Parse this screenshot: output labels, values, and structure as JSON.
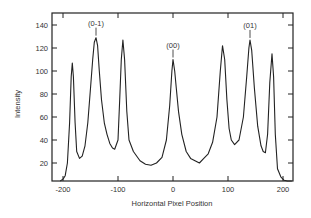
{
  "chart_data": {
    "type": "line",
    "title": "",
    "xlabel": "Horizontal Pixel Position",
    "ylabel": "Intensity",
    "xlim": [
      -220,
      220
    ],
    "ylim": [
      4,
      150
    ],
    "xticks": [
      -200,
      -100,
      0,
      100,
      200
    ],
    "yticks": [
      20,
      40,
      60,
      80,
      100,
      120,
      140
    ],
    "grid": false,
    "legend": null,
    "annotations": [
      {
        "text": "(0-1)",
        "x": -140,
        "y": 129
      },
      {
        "text": "(00)",
        "x": 0,
        "y": 110
      },
      {
        "text": "(01)",
        "x": 140,
        "y": 127
      }
    ],
    "series": [
      {
        "name": "Intensity profile",
        "x": [
          -205,
          -200,
          -196,
          -192,
          -188,
          -185,
          -183,
          -181,
          -178,
          -175,
          -170,
          -165,
          -160,
          -155,
          -150,
          -146,
          -143,
          -140,
          -137,
          -134,
          -130,
          -125,
          -120,
          -115,
          -110,
          -106,
          -100,
          -97,
          -94,
          -91,
          -88,
          -84,
          -80,
          -72,
          -60,
          -50,
          -40,
          -30,
          -20,
          -12,
          -6,
          -2,
          0,
          3,
          6,
          10,
          16,
          24,
          32,
          40,
          48,
          56,
          64,
          72,
          80,
          86,
          90,
          94,
          98,
          102,
          106,
          112,
          120,
          128,
          134,
          138,
          140,
          143,
          148,
          154,
          160,
          164,
          168,
          172,
          176,
          180,
          183,
          186,
          190,
          196,
          202,
          208,
          216
        ],
        "y": [
          4,
          6,
          9,
          20,
          55,
          95,
          107,
          95,
          55,
          30,
          24,
          26,
          35,
          55,
          85,
          110,
          125,
          129,
          122,
          100,
          75,
          55,
          45,
          37,
          33,
          32,
          40,
          75,
          110,
          127,
          110,
          65,
          40,
          30,
          22,
          19,
          18,
          20,
          25,
          40,
          70,
          100,
          110,
          100,
          85,
          65,
          45,
          30,
          24,
          22,
          20,
          24,
          28,
          38,
          60,
          100,
          122,
          110,
          75,
          50,
          40,
          36,
          40,
          60,
          95,
          120,
          127,
          118,
          85,
          52,
          35,
          30,
          29,
          45,
          90,
          115,
          95,
          45,
          15,
          8,
          5,
          4,
          4
        ]
      }
    ]
  }
}
